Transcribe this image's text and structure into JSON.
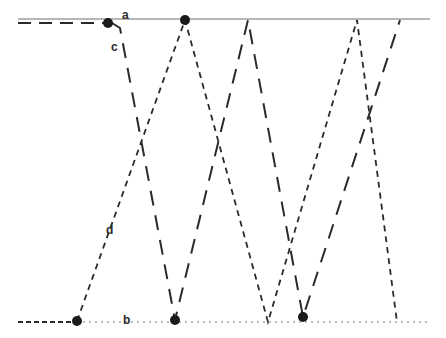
{
  "diagram": {
    "labels": {
      "a": "a",
      "b": "b",
      "c": "c",
      "d": "d"
    },
    "colors": {
      "line": "#2a2a2a",
      "reference_top": "#6e6e6e",
      "reference_bottom": "#7a7a7a",
      "dot": "#1a1a1a"
    },
    "top_reference_line": {
      "x1": 18,
      "x2": 430,
      "y": 19
    },
    "bottom_reference_line": {
      "x1": 18,
      "x2": 430,
      "y": 322
    },
    "dots": [
      {
        "x": 108,
        "y": 23
      },
      {
        "x": 185,
        "y": 20
      },
      {
        "x": 77,
        "y": 321
      },
      {
        "x": 175,
        "y": 320
      },
      {
        "x": 303,
        "y": 317
      }
    ],
    "long_dash_path": [
      [
        18,
        23
      ],
      [
        108,
        23
      ],
      [
        120,
        28
      ],
      [
        175,
        320
      ],
      [
        248,
        20
      ],
      [
        303,
        317
      ],
      [
        400,
        20
      ]
    ],
    "short_dash_path": [
      [
        18,
        322
      ],
      [
        77,
        322
      ],
      [
        185,
        20
      ],
      [
        268,
        322
      ],
      [
        357,
        20
      ],
      [
        397,
        322
      ]
    ]
  }
}
